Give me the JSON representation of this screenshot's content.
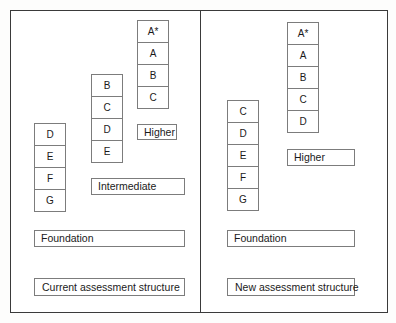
{
  "diagram": {
    "panels": [
      {
        "id": "current",
        "caption": "Current assessment structure",
        "foundation_label": "Foundation",
        "tiers": [
          {
            "name": "Foundation",
            "grades": [
              "D",
              "E",
              "F",
              "G"
            ],
            "tier_label": ""
          },
          {
            "name": "Intermediate",
            "grades": [
              "B",
              "C",
              "D",
              "E"
            ],
            "tier_label": "Intermediate"
          },
          {
            "name": "Higher",
            "grades": [
              "A*",
              "A",
              "B",
              "C"
            ],
            "tier_label": "Higher"
          }
        ]
      },
      {
        "id": "new",
        "caption": "New assessment structure",
        "foundation_label": "Foundation",
        "tiers": [
          {
            "name": "Foundation",
            "grades": [
              "C",
              "D",
              "E",
              "F",
              "G"
            ],
            "tier_label": ""
          },
          {
            "name": "Higher",
            "grades": [
              "A*",
              "A",
              "B",
              "C",
              "D"
            ],
            "tier_label": "Higher"
          }
        ]
      }
    ]
  },
  "left": {
    "grades_low": [
      "D",
      "E",
      "F",
      "G"
    ],
    "grades_mid": [
      "B",
      "C",
      "D",
      "E"
    ],
    "grades_high": [
      "A*",
      "A",
      "B",
      "C"
    ],
    "higher_label": "Higher",
    "intermediate_label": "Intermediate",
    "foundation_label": "Foundation",
    "caption": "Current assessment structure"
  },
  "right": {
    "grades_low": [
      "C",
      "D",
      "E",
      "F",
      "G"
    ],
    "grades_high": [
      "A*",
      "A",
      "B",
      "C",
      "D"
    ],
    "higher_label": "Higher",
    "foundation_label": "Foundation",
    "caption": "New assessment structure"
  },
  "colors": {
    "panel_border": "#3a3a3a",
    "box_border": "#7c7c7c",
    "text": "#1a1a1a",
    "background": "#ffffff"
  }
}
